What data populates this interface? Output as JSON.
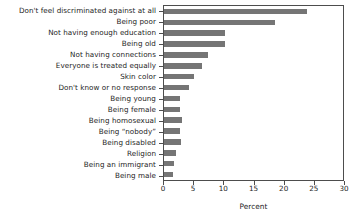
{
  "chart_data": {
    "type": "bar",
    "orientation": "horizontal",
    "title": "",
    "xlabel": "Percent",
    "ylabel": "",
    "xlim": [
      0,
      30
    ],
    "xticks": [
      0,
      5,
      10,
      15,
      20,
      25,
      30
    ],
    "xtick_labels": [
      "0",
      "5",
      "10",
      "15",
      "20",
      "25",
      "30"
    ],
    "grid": false,
    "legend": null,
    "bar_color": "#757575",
    "frame_color": "#4d4d4d",
    "categories": [
      "Don't feel discriminated against at all",
      "Being poor",
      "Not having enough education",
      "Being old",
      "Not having connections",
      "Everyone is treated equally",
      "Skin color",
      "Don't know or no response",
      "Being young",
      "Being female",
      "Being homosexual",
      "Being “nobody”",
      "Being disabled",
      "Religion",
      "Being an immigrant",
      "Being male"
    ],
    "values": [
      23.9,
      18.6,
      10.3,
      10.3,
      7.3,
      6.3,
      5.0,
      4.2,
      2.6,
      2.6,
      3.1,
      2.6,
      2.8,
      2.0,
      1.7,
      1.5
    ]
  }
}
